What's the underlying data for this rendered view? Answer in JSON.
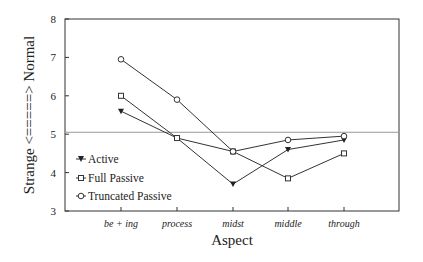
{
  "chart_data": {
    "type": "line",
    "title": "",
    "xlabel": "Aspect",
    "ylabel": "Strange <=====> Normal",
    "categories": [
      "be + ing",
      "process",
      "midst",
      "middle",
      "through"
    ],
    "ylim": [
      3,
      8
    ],
    "yticks": [
      3,
      4,
      5,
      6,
      7,
      8
    ],
    "reference_line": 5.05,
    "grid": false,
    "legend_position": "lower left inside",
    "series": [
      {
        "name": "Active",
        "marker": "triangle-down-filled",
        "values": [
          5.6,
          4.9,
          3.7,
          4.6,
          4.85
        ]
      },
      {
        "name": "Full Passive",
        "marker": "square-open",
        "values": [
          6.0,
          4.9,
          4.55,
          3.85,
          4.5
        ]
      },
      {
        "name": "Truncated Passive",
        "marker": "circle-open",
        "values": [
          6.95,
          5.9,
          4.55,
          4.85,
          4.95
        ]
      }
    ]
  },
  "legend": {
    "items": [
      "Active",
      "Full Passive",
      "Truncated Passive"
    ]
  }
}
